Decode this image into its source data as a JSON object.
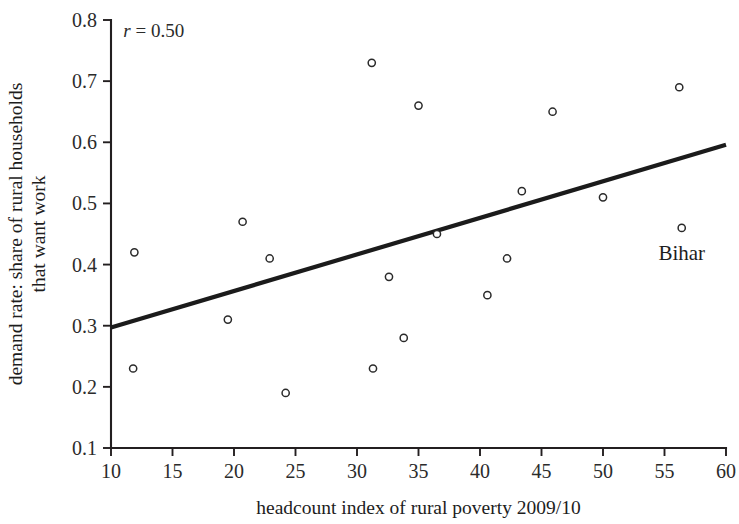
{
  "chart_data": {
    "type": "scatter",
    "title": "",
    "xlabel": "headcount index of rural poverty 2009/10",
    "ylabel_line1": "demand rate: share of rural households",
    "ylabel_line2": "that want work",
    "xlim": [
      10,
      60
    ],
    "ylim": [
      0.1,
      0.8
    ],
    "grid": false,
    "legend": "none",
    "xticks": [
      10,
      15,
      20,
      25,
      30,
      35,
      40,
      45,
      50,
      55,
      60
    ],
    "xtick_labels": [
      "10",
      "15",
      "20",
      "25",
      "30",
      "35",
      "40",
      "45",
      "50",
      "55",
      "60"
    ],
    "yticks": [
      0.1,
      0.2,
      0.3,
      0.4,
      0.5,
      0.6,
      0.7,
      0.8
    ],
    "ytick_labels": [
      "0.1",
      "0.2",
      "0.3",
      "0.4",
      "0.5",
      "0.6",
      "0.7",
      "0.8"
    ],
    "annotations": [
      {
        "name": "correlation",
        "prefix": "r",
        "text": " = 0.50",
        "x": 11.0,
        "y": 0.773
      }
    ],
    "point_labels": [
      {
        "name": "Bihar",
        "text": "Bihar",
        "x": 56.4,
        "y": 0.408
      }
    ],
    "points": [
      {
        "x": 11.9,
        "y": 0.42
      },
      {
        "x": 11.8,
        "y": 0.23
      },
      {
        "x": 19.5,
        "y": 0.31
      },
      {
        "x": 20.7,
        "y": 0.47
      },
      {
        "x": 22.9,
        "y": 0.41
      },
      {
        "x": 24.2,
        "y": 0.19
      },
      {
        "x": 31.2,
        "y": 0.73
      },
      {
        "x": 31.3,
        "y": 0.23
      },
      {
        "x": 32.6,
        "y": 0.38
      },
      {
        "x": 33.8,
        "y": 0.28
      },
      {
        "x": 35.0,
        "y": 0.66
      },
      {
        "x": 36.5,
        "y": 0.45
      },
      {
        "x": 40.6,
        "y": 0.35
      },
      {
        "x": 42.2,
        "y": 0.41
      },
      {
        "x": 43.4,
        "y": 0.52
      },
      {
        "x": 45.9,
        "y": 0.65
      },
      {
        "x": 50.0,
        "y": 0.51
      },
      {
        "x": 56.2,
        "y": 0.69
      },
      {
        "x": 56.4,
        "y": 0.46
      }
    ],
    "trendline": {
      "x0": 10.0,
      "y0": 0.297,
      "x1": 60.0,
      "y1": 0.596
    },
    "colors": {
      "axis": "#231f20",
      "marker_stroke": "#2a2a2a",
      "marker_fill": "#ffffff",
      "trendline": "#1b1b1b",
      "text": "#1d1d1d",
      "background": "#ffffff"
    }
  }
}
